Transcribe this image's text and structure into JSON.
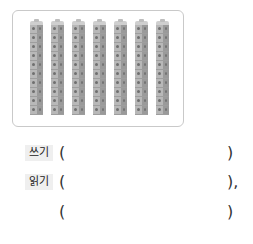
{
  "figure": {
    "rod_count": 7,
    "cubes_per_rod": 10,
    "cube_color": "#b8b8b8"
  },
  "answers": [
    {
      "label": "쓰기",
      "open": "(",
      "value": "",
      "close": ")"
    },
    {
      "label": "읽기",
      "open": "(",
      "value": "",
      "close": "),"
    },
    {
      "label": "",
      "open": "(",
      "value": "",
      "close": ")"
    }
  ]
}
